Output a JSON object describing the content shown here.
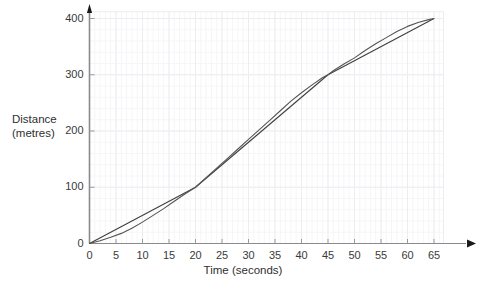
{
  "chart_data": {
    "type": "line",
    "title": "",
    "xlabel": "Time (seconds)",
    "ylabel_line1": "Distance",
    "ylabel_line2": "(metres)",
    "xlim": [
      0,
      68
    ],
    "ylim": [
      0,
      420
    ],
    "x_ticks": [
      0,
      5,
      10,
      15,
      20,
      25,
      30,
      35,
      40,
      45,
      50,
      55,
      60,
      65
    ],
    "x_tick_labels": [
      "0",
      "5",
      "10",
      "15",
      "20",
      "25",
      "30",
      "35",
      "40",
      "45",
      "50",
      "55",
      "60",
      "65"
    ],
    "y_ticks": [
      0,
      100,
      200,
      300,
      400
    ],
    "y_tick_labels": [
      "0",
      "100",
      "200",
      "300",
      "400"
    ],
    "grid": true,
    "grid_major_step_x": 5,
    "grid_major_step_y": 100,
    "grid_minor_step_x": 1,
    "grid_minor_step_y": 20,
    "legend": "none",
    "axis_arrow_x": true,
    "axis_arrow_y": true,
    "series": [
      {
        "name": "distance-time curve",
        "type": "curve",
        "color": "#555555",
        "x": [
          0,
          2,
          4,
          6,
          8,
          10,
          12,
          14,
          16,
          18,
          20,
          22,
          24,
          26,
          28,
          30,
          32,
          34,
          36,
          38,
          40,
          42,
          44,
          45,
          46,
          48,
          50,
          52,
          54,
          56,
          58,
          60,
          62,
          64,
          65
        ],
        "y": [
          0,
          5,
          11,
          18,
          27,
          38,
          50,
          62,
          75,
          88,
          100,
          117,
          134,
          151,
          168,
          185,
          202,
          219,
          236,
          253,
          268,
          282,
          295,
          300,
          307,
          319,
          330,
          343,
          355,
          366,
          377,
          386,
          393,
          398,
          400
        ]
      },
      {
        "name": "chord-0-to-20",
        "type": "chord",
        "color": "#3f3f3f",
        "x": [
          0,
          20
        ],
        "y": [
          0,
          100
        ]
      },
      {
        "name": "chord-20-to-45",
        "type": "chord",
        "color": "#3f3f3f",
        "x": [
          20,
          45
        ],
        "y": [
          100,
          300
        ]
      },
      {
        "name": "chord-45-to-65",
        "type": "chord",
        "color": "#3f3f3f",
        "x": [
          45,
          65
        ],
        "y": [
          300,
          400
        ]
      }
    ],
    "chord_points": [
      {
        "t": 0,
        "d": 0
      },
      {
        "t": 20,
        "d": 100
      },
      {
        "t": 45,
        "d": 300
      },
      {
        "t": 65,
        "d": 400
      }
    ]
  },
  "colors": {
    "curve": "#555555",
    "chord": "#3f3f3f",
    "axis": "#8a8a8a",
    "grid_major": "#ededf0",
    "grid_minor": "#f6f6f8",
    "text": "#333333",
    "arrow": "#1a1a1a"
  }
}
